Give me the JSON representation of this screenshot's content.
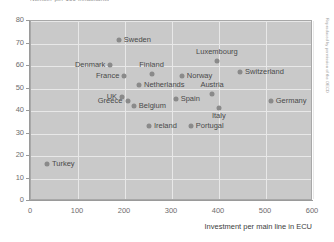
{
  "chart_data": {
    "type": "scatter",
    "title": "Number per 100 inhabitants",
    "xlabel": "Investment per main line in ECU",
    "ylabel": "",
    "xlim": [
      0,
      600
    ],
    "ylim": [
      0,
      80
    ],
    "xticks": [
      0,
      100,
      200,
      300,
      400,
      500,
      600
    ],
    "yticks": [
      0,
      10,
      20,
      30,
      40,
      50,
      60,
      70,
      80
    ],
    "grid": true,
    "legend": "none",
    "points": [
      {
        "name": "Sweden",
        "x": 189,
        "y": 71,
        "label_pos": "right"
      },
      {
        "name": "Denmark",
        "x": 170,
        "y": 60,
        "label_pos": "left"
      },
      {
        "name": "Finland",
        "x": 259,
        "y": 56,
        "label_pos": "above"
      },
      {
        "name": "France",
        "x": 200,
        "y": 55,
        "label_pos": "left"
      },
      {
        "name": "Norway",
        "x": 323,
        "y": 55,
        "label_pos": "right"
      },
      {
        "name": "Netherlands",
        "x": 232,
        "y": 51,
        "label_pos": "right"
      },
      {
        "name": "UK",
        "x": 195,
        "y": 46,
        "label_pos": "left"
      },
      {
        "name": "Greece",
        "x": 208,
        "y": 44,
        "label_pos": "left"
      },
      {
        "name": "Belgium",
        "x": 221,
        "y": 42,
        "label_pos": "right"
      },
      {
        "name": "Luxembourg",
        "x": 398,
        "y": 62,
        "label_pos": "above"
      },
      {
        "name": "Switzerland",
        "x": 447,
        "y": 57,
        "label_pos": "right"
      },
      {
        "name": "Austria",
        "x": 387,
        "y": 47,
        "label_pos": "above"
      },
      {
        "name": "Spain",
        "x": 310,
        "y": 45,
        "label_pos": "right"
      },
      {
        "name": "Germany",
        "x": 512,
        "y": 44,
        "label_pos": "right"
      },
      {
        "name": "Italy",
        "x": 402,
        "y": 41,
        "label_pos": "below"
      },
      {
        "name": "Ireland",
        "x": 253,
        "y": 33,
        "label_pos": "right"
      },
      {
        "name": "Portugal",
        "x": 342,
        "y": 33,
        "label_pos": "right"
      },
      {
        "name": "Turkey",
        "x": 36,
        "y": 16,
        "label_pos": "right"
      }
    ]
  },
  "side_credit": "Reproduced by permission of the OECD"
}
